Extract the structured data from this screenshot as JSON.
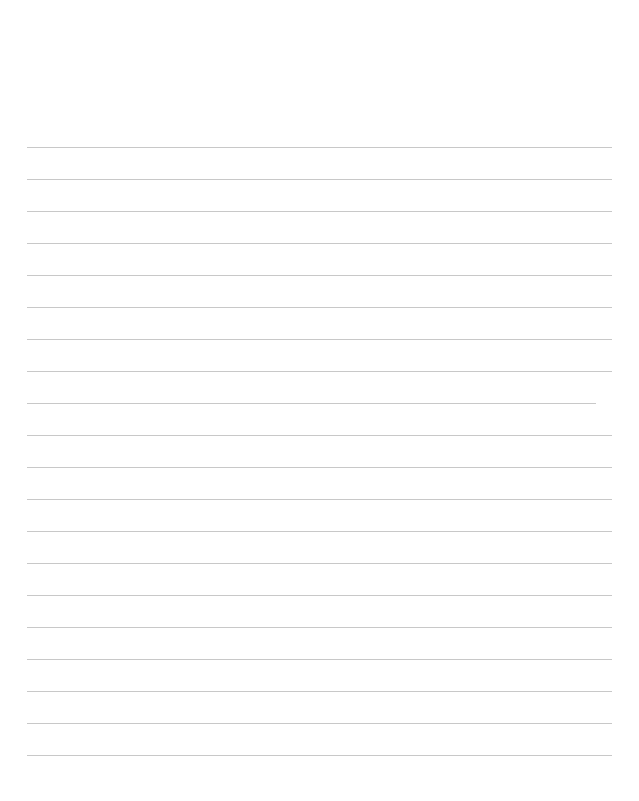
{
  "page": {
    "type": "lined-paper",
    "width": 639,
    "height": 801,
    "background": "#ffffff",
    "rule_color": "#c8c8c8",
    "rule_thickness": 1,
    "rule_left": 27,
    "rule_right": 612,
    "rule_spacing": 32,
    "first_rule_y": 147
  },
  "rules": [
    {
      "y": 147,
      "x1": 27,
      "x2": 612
    },
    {
      "y": 179,
      "x1": 27,
      "x2": 612
    },
    {
      "y": 211,
      "x1": 27,
      "x2": 612
    },
    {
      "y": 243,
      "x1": 27,
      "x2": 612
    },
    {
      "y": 275,
      "x1": 27,
      "x2": 612
    },
    {
      "y": 307,
      "x1": 27,
      "x2": 612
    },
    {
      "y": 339,
      "x1": 27,
      "x2": 612
    },
    {
      "y": 371,
      "x1": 27,
      "x2": 612
    },
    {
      "y": 403,
      "x1": 27,
      "x2": 596
    },
    {
      "y": 435,
      "x1": 27,
      "x2": 612
    },
    {
      "y": 467,
      "x1": 27,
      "x2": 612
    },
    {
      "y": 499,
      "x1": 27,
      "x2": 612
    },
    {
      "y": 531,
      "x1": 27,
      "x2": 612
    },
    {
      "y": 563,
      "x1": 27,
      "x2": 612
    },
    {
      "y": 595,
      "x1": 27,
      "x2": 612
    },
    {
      "y": 627,
      "x1": 27,
      "x2": 612
    },
    {
      "y": 659,
      "x1": 27,
      "x2": 612
    },
    {
      "y": 691,
      "x1": 27,
      "x2": 612
    },
    {
      "y": 723,
      "x1": 27,
      "x2": 612
    },
    {
      "y": 755,
      "x1": 27,
      "x2": 612
    }
  ]
}
